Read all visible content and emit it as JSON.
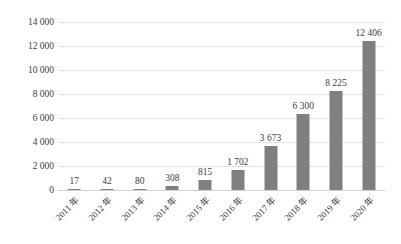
{
  "chart_data": {
    "type": "bar",
    "title": "",
    "subtitle": "",
    "xlabel": "",
    "ylabel": "",
    "categories": [
      "2011 年",
      "2012 年",
      "2013 年",
      "2014 年",
      "2015 年",
      "2016 年",
      "2017 年",
      "2018 年",
      "2019 年",
      "2020 年"
    ],
    "values": [
      17,
      42,
      80,
      308,
      815,
      1702,
      3673,
      6300,
      8225,
      12406
    ],
    "value_labels": [
      "17",
      "42",
      "80",
      "308",
      "815",
      "1 702",
      "3 673",
      "6 300",
      "8 225",
      "12 406"
    ],
    "ylim": [
      0,
      14000
    ],
    "ytick_values": [
      0,
      2000,
      4000,
      6000,
      8000,
      10000,
      12000,
      14000
    ],
    "ytick_labels": [
      "0",
      "2 000",
      "4 000",
      "6 000",
      "8 000",
      "10 000",
      "12 000",
      "14 000"
    ],
    "grid": true,
    "legend": false,
    "legend_position": "none",
    "bar_color": "#808080",
    "gridline_color": "#e2e2e2",
    "axis_color": "#d2d2d2",
    "background_color": "#ffffff",
    "text_color": "#3d3d3d",
    "data_labels_shown": true
  }
}
